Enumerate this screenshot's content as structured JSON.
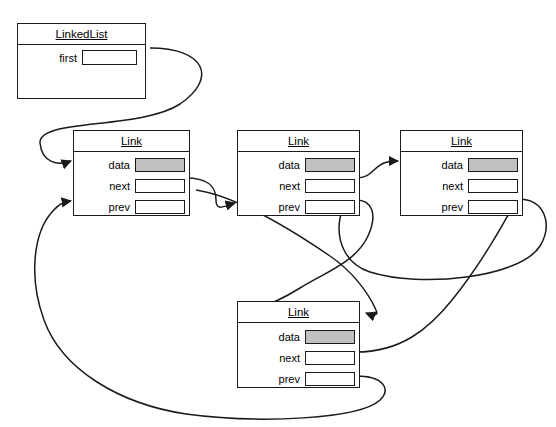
{
  "diagram": {
    "cut_off_caption": "",
    "colors": {
      "stroke": "#1a1a1a",
      "background": "#ffffff",
      "data_fill": "#c0c0c0"
    },
    "nodes": [
      {
        "id": "linkedlist",
        "name": "LinkedList",
        "type": "class-box",
        "x": 17,
        "y": 23,
        "w": 129,
        "h": 76,
        "fields": [
          {
            "label": "first",
            "slot": "empty",
            "slot_name": "first-pointer-slot"
          }
        ]
      },
      {
        "id": "link1",
        "name": "Link",
        "type": "class-box",
        "x": 73,
        "y": 130,
        "w": 117,
        "h": 86,
        "fields": [
          {
            "label": "data",
            "slot": "filled",
            "slot_name": "data-slot"
          },
          {
            "label": "next",
            "slot": "empty",
            "slot_name": "next-slot"
          },
          {
            "label": "prev",
            "slot": "empty",
            "slot_name": "prev-slot"
          }
        ]
      },
      {
        "id": "link2",
        "name": "Link",
        "type": "class-box",
        "x": 237,
        "y": 130,
        "w": 123,
        "h": 86,
        "fields": [
          {
            "label": "data",
            "slot": "filled",
            "slot_name": "data-slot"
          },
          {
            "label": "next",
            "slot": "empty",
            "slot_name": "next-slot"
          },
          {
            "label": "prev",
            "slot": "empty",
            "slot_name": "prev-slot"
          }
        ]
      },
      {
        "id": "link3",
        "name": "Link",
        "type": "class-box",
        "x": 400,
        "y": 130,
        "w": 123,
        "h": 86,
        "fields": [
          {
            "label": "data",
            "slot": "filled",
            "slot_name": "data-slot"
          },
          {
            "label": "next",
            "slot": "empty",
            "slot_name": "next-slot"
          },
          {
            "label": "prev",
            "slot": "empty",
            "slot_name": "prev-slot"
          }
        ]
      },
      {
        "id": "link4",
        "name": "Link",
        "type": "class-box",
        "x": 237,
        "y": 301,
        "w": 123,
        "h": 87,
        "fields": [
          {
            "label": "data",
            "slot": "filled",
            "slot_name": "data-slot"
          },
          {
            "label": "next",
            "slot": "empty",
            "slot_name": "next-slot"
          },
          {
            "label": "prev",
            "slot": "empty",
            "slot_name": "prev-slot"
          }
        ]
      }
    ],
    "edges": [
      {
        "id": "e1",
        "from": "linkedlist.first",
        "to": "link1.left",
        "label": ""
      },
      {
        "id": "e2",
        "from": "link1.next",
        "to": "link2.prev-left",
        "label": ""
      },
      {
        "id": "e3",
        "from": "link2.next",
        "to": "link3.data-left",
        "label": ""
      },
      {
        "id": "e4",
        "from": "link3.prev",
        "to": "link2.prev-bottom",
        "label": ""
      },
      {
        "id": "e5",
        "from": "link2.prev",
        "to": "link4.title-left",
        "label": ""
      },
      {
        "id": "e6",
        "from": "link1.prev-left",
        "to": "link4.title-right",
        "label": ""
      },
      {
        "id": "e7",
        "from": "link4.next",
        "to": "link3.prev-right",
        "label": ""
      },
      {
        "id": "e8",
        "from": "link4.prev",
        "to": "link1.prev-left",
        "label": ""
      }
    ]
  }
}
